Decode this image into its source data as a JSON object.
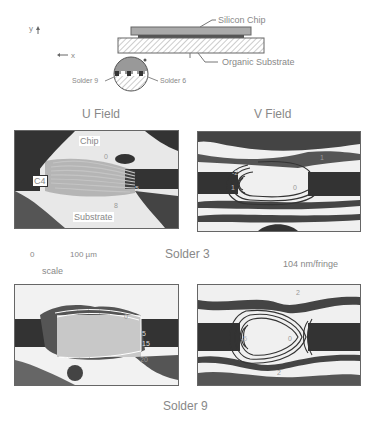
{
  "schematic": {
    "axis_y": "y",
    "axis_x": "x",
    "silicon_chip": "Silicon Chip",
    "organic_substrate": "Organic Substrate",
    "solder_left": "Solder 9",
    "solder_right": "Solder 6"
  },
  "columns": {
    "u_field": "U Field",
    "v_field": "V Field"
  },
  "solder3": {
    "caption": "Solder 3",
    "u_panel": {
      "chip": "Chip",
      "c4": "C4",
      "substrate": "Substrate",
      "n0": "0",
      "n5": "5",
      "n8": "8"
    },
    "v_panel": {
      "nm2": "-2",
      "n1a": "1",
      "n0": "0",
      "n1b": "1"
    }
  },
  "scale": {
    "zero": "0",
    "length": "100 µm",
    "label": "scale",
    "fringe": "104 nm/fringe"
  },
  "solder9": {
    "caption": "Solder 9",
    "u_panel": {
      "n0": "0",
      "n5": "5",
      "n15": "15",
      "n20": "20"
    },
    "v_panel": {
      "n2a": "2",
      "nm5": "-5",
      "n0": "0",
      "n2b": "2"
    }
  },
  "colors": {
    "ink": "#333333",
    "label": "#888888",
    "border": "#666666"
  }
}
